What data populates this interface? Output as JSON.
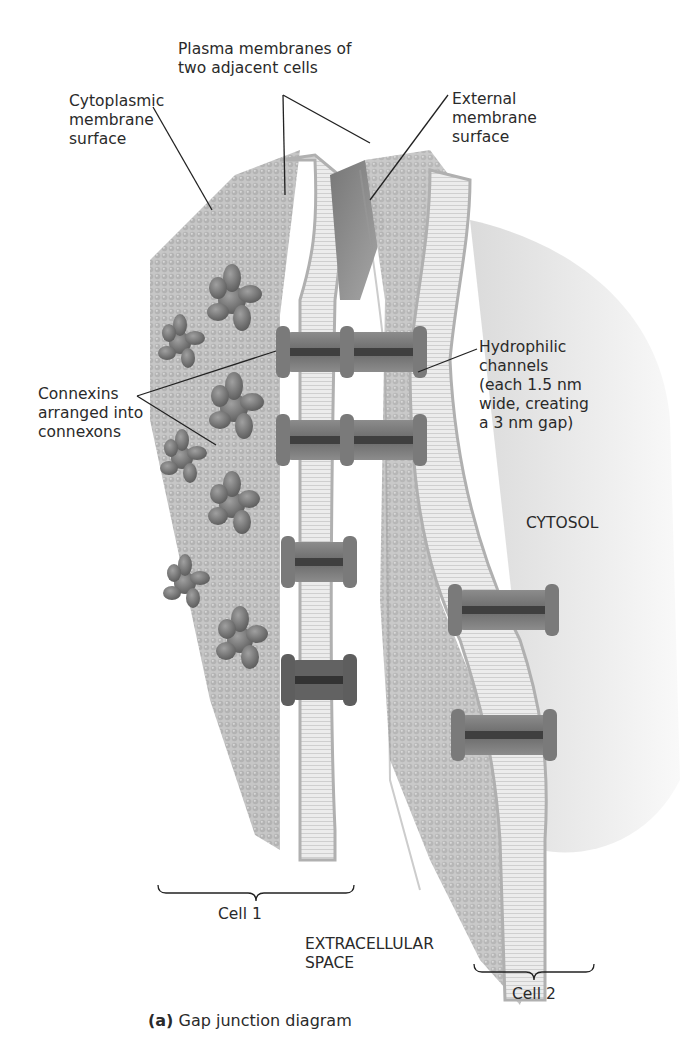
{
  "figure": {
    "caption_prefix": "(a)",
    "caption_text": "Gap junction diagram"
  },
  "labels": {
    "plasma_membranes": "Plasma membranes of\ntwo adjacent cells",
    "cytoplasmic_surface": "Cytoplasmic\nmembrane\nsurface",
    "external_surface": "External\nmembrane\nsurface",
    "connexins": "Connexins\narranged into\nconnexons",
    "hydrophilic_channels": "Hydrophilic\nchannels\n(each 1.5 nm\nwide, creating\na 3 nm gap)",
    "cytosol": "CYTOSOL",
    "extracellular_space": "EXTRACELLULAR\nSPACE",
    "cell1": "Cell 1",
    "cell2": "Cell 2"
  },
  "colors": {
    "membrane_light": "#d9d9d9",
    "membrane_mid": "#b5b5b5",
    "membrane_dark": "#8a8a8a",
    "protein": "#7a7a7a",
    "protein_dark": "#555555"
  }
}
